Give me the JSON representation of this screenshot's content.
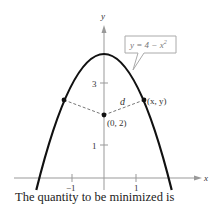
{
  "figure": {
    "axes": {
      "x_label": "x",
      "y_label": "y",
      "x_ticks": [
        {
          "value": -1,
          "label": "−1"
        },
        {
          "value": 1,
          "label": "1"
        }
      ],
      "y_ticks": [
        {
          "value": 1,
          "label": "1"
        },
        {
          "value": 3,
          "label": "3"
        }
      ]
    },
    "curve": {
      "equation_label": "y = 4 − x²",
      "eq_lhs": "y = 4 − x",
      "eq_exp": "2"
    },
    "points": {
      "center_label": "(0, 2)",
      "right_label": "(x, y)"
    },
    "distance_label": "d"
  },
  "caption": "The quantity to be minimized is"
}
